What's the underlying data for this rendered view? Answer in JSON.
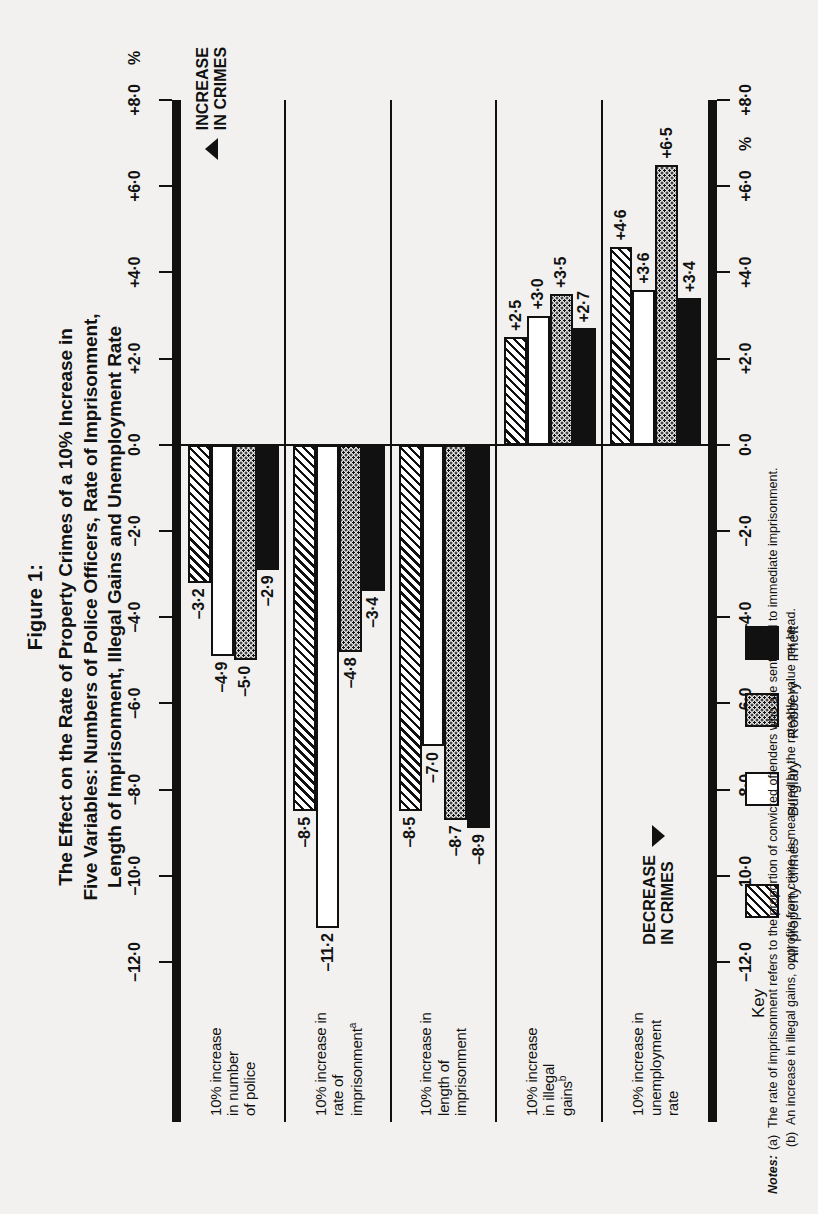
{
  "figure": {
    "number": "Figure 1:",
    "title_lines": [
      "The Effect on the Rate of Property Crimes of a 10% Increase in",
      "Five Variables: Numbers of Police Officers, Rate of Imprisonment,",
      "Length of Imprisonment, Illegal Gains and Unemployment Rate"
    ]
  },
  "axis": {
    "unit_prefix": "%",
    "unit_suffix": "%",
    "tick_labels": [
      "+8·0",
      "+6·0",
      "+4·0",
      "+2·0",
      "0·0",
      "–2·0",
      "–4·0",
      "–6·0",
      "–8·0",
      "–10·0",
      "–12·0"
    ],
    "tick_values": [
      8,
      6,
      4,
      2,
      0,
      -2,
      -4,
      -6,
      -8,
      -10,
      -12
    ],
    "min": -12,
    "max": 8
  },
  "annotations": {
    "increase": {
      "line1": "INCREASE",
      "line2": "IN CRIMES"
    },
    "decrease": {
      "line1": "DECREASE",
      "line2": "IN CRIMES"
    }
  },
  "key": {
    "title": "Key",
    "items": [
      {
        "label": "All property crimes",
        "fill": "hatch"
      },
      {
        "label": "Burglary",
        "fill": "white"
      },
      {
        "label": "Robbery",
        "fill": "dots"
      },
      {
        "label": "Theft",
        "fill": "black"
      }
    ]
  },
  "notes": {
    "head": "Notes:",
    "items": [
      {
        "key": "(a)",
        "text": "The rate of imprisonment refers to the proportion of convicted offenders who are sentenced to immediate imprisonment."
      },
      {
        "key": "(b)",
        "text": "An increase in illegal gains, or profits from crime, is measured by the rateable value per head."
      }
    ]
  },
  "chart_data": {
    "type": "bar",
    "xlabel": "",
    "ylabel": "%",
    "ylim": [
      -12,
      8
    ],
    "grid": false,
    "legend_position": "bottom",
    "orientation": "horizontal-grouped",
    "categories": [
      "10% increase in number of police",
      "10% increase in rate of imprisonmentᵃ",
      "10% increase in length of imprisonment",
      "10% increase in illegal gainsᵇ",
      "10% increase in unemployment rate"
    ],
    "series": [
      {
        "name": "All property crimes",
        "fill": "hatch",
        "values": [
          -3.2,
          -8.5,
          -8.5,
          2.5,
          4.6
        ]
      },
      {
        "name": "Burglary",
        "fill": "white",
        "values": [
          -4.9,
          -11.2,
          -7.0,
          3.0,
          3.6
        ]
      },
      {
        "name": "Robbery",
        "fill": "dots",
        "values": [
          -5.0,
          -4.8,
          -8.7,
          3.5,
          6.5
        ]
      },
      {
        "name": "Theft",
        "fill": "black",
        "values": [
          -2.9,
          -3.4,
          -8.9,
          2.7,
          3.4
        ]
      }
    ],
    "data_labels": [
      [
        "–3·2",
        "–4·9",
        "–5·0",
        "–2·9"
      ],
      [
        "–8·5",
        "–11·2",
        "–4·8",
        "–3·4"
      ],
      [
        "–8·5",
        "–7·0",
        "–8·7",
        "–8·9"
      ],
      [
        "+2·5",
        "+3·0",
        "+3·5",
        "+2·7"
      ],
      [
        "+4·6",
        "+3·6",
        "+6·5",
        "+3·4"
      ]
    ],
    "group_labels_html": [
      "10% increase<br>in number<br>of police",
      "10% increase in<br>rate of<br>imprisonment<sup>a</sup>",
      "10% increase in<br>length of<br>imprisonment",
      "10% increase<br>in illegal<br>gains<sup>b</sup>",
      "10% increase in<br>unemployment<br>rate"
    ]
  }
}
